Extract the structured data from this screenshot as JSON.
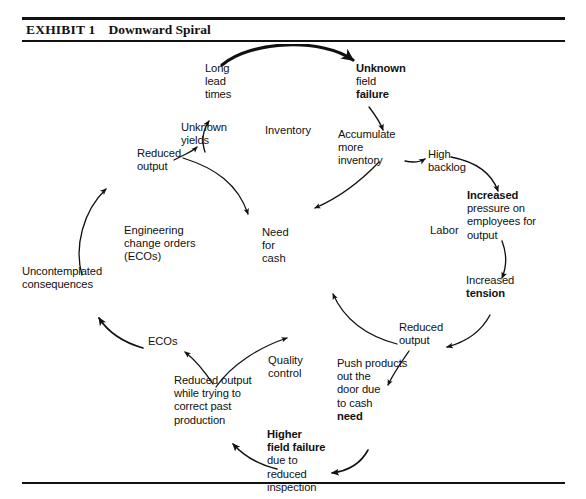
{
  "header": {
    "exhibit_label": "EXHIBIT 1",
    "exhibit_title": "Downward Spiral"
  },
  "hubs": {
    "inventory": "Inventory",
    "labor": "Labor",
    "quality_control": "Quality\ncontrol",
    "eco": "Engineering\nchange orders\n(ECOs)",
    "center": "Need\nfor\ncash"
  },
  "nodes": {
    "long_lead_times": "Long\nlead\ntimes",
    "unknown_field_failure_bold1": "Unknown",
    "unknown_field_failure_reg": "field",
    "unknown_field_failure_bold2": "failure",
    "accumulate_more_inventory": "Accumulate\nmore\ninventory",
    "high_backlog": "High\nbacklog",
    "increased_pressure_bold": "Increased",
    "increased_pressure_reg": "pressure on\nemployees for\noutput",
    "increased_tension_reg": "Increased",
    "increased_tension_bold": "tension",
    "reduced_output_labor": "Reduced\noutput",
    "push_products_reg": "Push products\nout the\ndoor due\nto cash",
    "push_products_bold": "need",
    "higher_field_failure_bold": "Higher\nfield failure",
    "higher_field_failure_reg": "due to\nreduced\ninspection",
    "reduced_output_while": "Reduced output\nwhile trying to\ncorrect past\nproduction",
    "ecos": "ECOs",
    "uncontemplated_consequences": "Uncontemplated\nconsequences",
    "reduced_output_eco": "Reduced\noutput",
    "unknown_yields": "Unknown\nyields"
  },
  "colors": {
    "ink": "#111111",
    "paper": "#ffffff"
  }
}
